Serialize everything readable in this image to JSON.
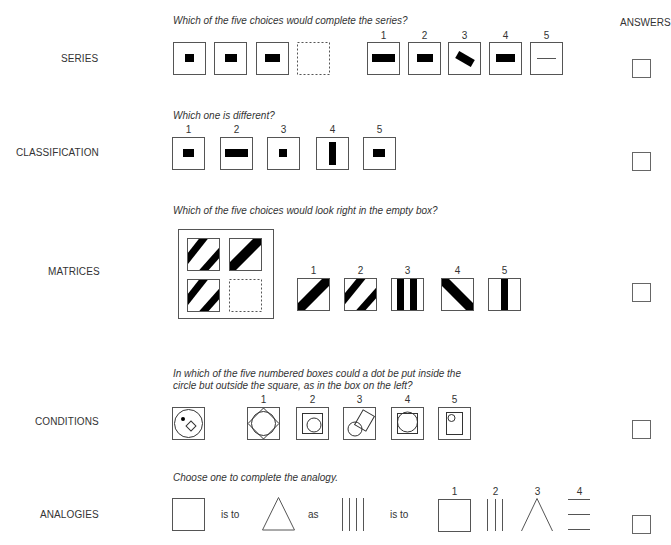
{
  "answers_header": "ANSWERS",
  "sections": {
    "series": {
      "label": "SERIES",
      "question": "Which of the five choices would complete the series?",
      "choice_numbers": [
        "1",
        "2",
        "3",
        "4",
        "5"
      ]
    },
    "classification": {
      "label": "CLASSIFICATION",
      "question": "Which one is different?",
      "choice_numbers": [
        "1",
        "2",
        "3",
        "4",
        "5"
      ]
    },
    "matrices": {
      "label": "MATRICES",
      "question": "Which of the five choices would look right in the empty box?",
      "choice_numbers": [
        "1",
        "2",
        "3",
        "4",
        "5"
      ]
    },
    "conditions": {
      "label": "CONDITIONS",
      "question_line1": "In which of the five numbered boxes could a dot be put inside the",
      "question_line2": "circle but outside the square, as in the box on the left?",
      "choice_numbers": [
        "1",
        "2",
        "3",
        "4",
        "5"
      ]
    },
    "analogies": {
      "label": "ANALOGIES",
      "question": "Choose one to complete the analogy.",
      "word_is_to_1": "is to",
      "word_as": "as",
      "word_is_to_2": "is to",
      "choice_numbers": [
        "1",
        "2",
        "3",
        "4"
      ]
    }
  },
  "colors": {
    "stroke": "#555555",
    "fill": "#000000",
    "background": "#ffffff"
  }
}
